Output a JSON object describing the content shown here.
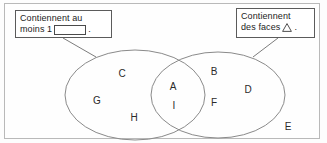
{
  "diagram": {
    "frame_color": "#b9b9b9",
    "background_color": "#fdfdfd",
    "ellipse_stroke": "#8a8a8a"
  },
  "callouts": [
    {
      "id": "left",
      "line1": "Contiennent au",
      "line2_prefix": "moins 1",
      "line2_suffix": ".",
      "icon": "rectangle-glyph",
      "border_color": "#5b5b5b"
    },
    {
      "id": "right",
      "line1": "Contiennent",
      "line2_prefix": "des faces",
      "line2_suffix": ".",
      "icon": "triangle-glyph",
      "border_color": "#5b5b5b"
    }
  ],
  "sets": {
    "left_only": [
      "C",
      "G",
      "H"
    ],
    "intersection": [
      "A",
      "I"
    ],
    "right_only": [
      "B",
      "D",
      "F"
    ],
    "outside": [
      "E"
    ]
  },
  "labels": [
    {
      "text": "C",
      "x": 122,
      "y": 73,
      "region": "left_only"
    },
    {
      "text": "G",
      "x": 97,
      "y": 100,
      "region": "left_only"
    },
    {
      "text": "H",
      "x": 134,
      "y": 117,
      "region": "left_only"
    },
    {
      "text": "A",
      "x": 173,
      "y": 86,
      "region": "intersection"
    },
    {
      "text": "I",
      "x": 174,
      "y": 105,
      "region": "intersection"
    },
    {
      "text": "B",
      "x": 214,
      "y": 71,
      "region": "right_only"
    },
    {
      "text": "D",
      "x": 248,
      "y": 89,
      "region": "right_only"
    },
    {
      "text": "F",
      "x": 214,
      "y": 102,
      "region": "right_only"
    },
    {
      "text": "E",
      "x": 288,
      "y": 126,
      "region": "outside"
    }
  ],
  "geometry": {
    "left_ellipse": {
      "cx": 135,
      "cy": 95,
      "rx": 70,
      "ry": 45
    },
    "right_ellipse": {
      "cx": 218,
      "cy": 95,
      "rx": 67,
      "ry": 43
    },
    "leader_left": {
      "x1": 63,
      "y1": 38,
      "x2": 96,
      "y2": 57
    },
    "leader_right": {
      "x1": 278,
      "y1": 38,
      "x2": 253,
      "y2": 57
    }
  }
}
